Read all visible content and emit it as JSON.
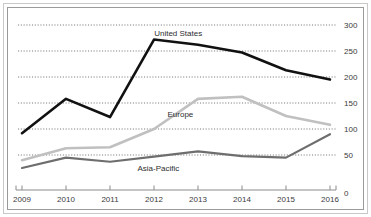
{
  "figure": {
    "cropped_caption_sliver": "",
    "frame_color": "#9a9a9a",
    "background": "#ffffff"
  },
  "chart_data": {
    "type": "line",
    "title": "",
    "subtitle": "",
    "xlabel": "",
    "ylabel": "",
    "categories": [
      "2009",
      "2010",
      "2011",
      "2012",
      "2013",
      "2014",
      "2015",
      "2016"
    ],
    "x": [
      2009,
      2010,
      2011,
      2012,
      2013,
      2014,
      2015,
      2016
    ],
    "xlim": [
      2009,
      2016
    ],
    "ylim": [
      0,
      300
    ],
    "yticks": [
      0,
      50,
      100,
      150,
      200,
      250,
      300
    ],
    "ytick_labels": [
      "0",
      "50",
      "100",
      "150",
      "200",
      "250",
      "300"
    ],
    "xtick_labels": [
      "2009",
      "2010",
      "2011",
      "2012",
      "2013",
      "2014",
      "2015",
      "2016"
    ],
    "grid": "horizontal-dotted",
    "y_axis_position": "right",
    "legend": "inline-annotations",
    "series": [
      {
        "name": "United States",
        "color": "#111111",
        "width": 2.6,
        "values": [
          92,
          158,
          123,
          272,
          262,
          247,
          213,
          195
        ],
        "label_x": 2012.55,
        "label_y": 285
      },
      {
        "name": "Europe",
        "color": "#c0c0c0",
        "width": 2.6,
        "values": [
          40,
          63,
          65,
          100,
          158,
          162,
          125,
          108
        ],
        "label_x": 2012.6,
        "label_y": 128
      },
      {
        "name": "Asia-Pacific",
        "color": "#6e6e6e",
        "width": 2.2,
        "values": [
          25,
          45,
          37,
          47,
          57,
          48,
          45,
          90
        ],
        "label_x": 2012.1,
        "label_y": 25
      }
    ],
    "gridline_color": "#5a5a5a",
    "axis_color": "#8c8c8c"
  }
}
